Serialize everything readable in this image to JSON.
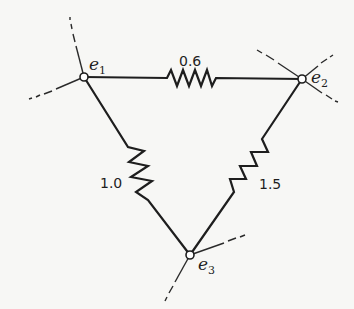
{
  "diagram": {
    "type": "resistor-network-triangle",
    "nodes": [
      {
        "id": "e1",
        "label": "e",
        "subscript": "1"
      },
      {
        "id": "e2",
        "label": "e",
        "subscript": "2"
      },
      {
        "id": "e3",
        "label": "e",
        "subscript": "3"
      }
    ],
    "edges": [
      {
        "from": "e1",
        "to": "e2",
        "resistance": "0.6"
      },
      {
        "from": "e1",
        "to": "e3",
        "resistance": "1.0"
      },
      {
        "from": "e2",
        "to": "e3",
        "resistance": "1.5"
      }
    ],
    "external_connections": {
      "e1": 2,
      "e2": 3,
      "e3": 2
    },
    "colors": {
      "ink": "#1e1e1e",
      "background": "#f7f7f5"
    }
  }
}
